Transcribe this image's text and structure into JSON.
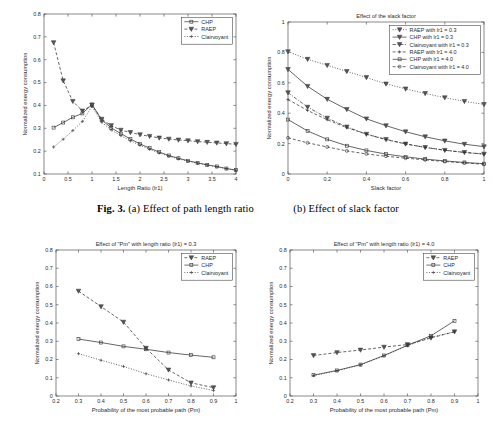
{
  "figure": {
    "caption_label": "Fig. 3.",
    "caption_a": "(a) Effect of path length ratio",
    "caption_b": "(b) Effect of slack factor"
  },
  "axis_common": {
    "ylabel": "Normalized energy consumption"
  },
  "chart_data": [
    {
      "id": "a",
      "type": "line",
      "title": "",
      "xlabel": "Length Ratio (lr1)",
      "ylabel": "Normalized energy consumption",
      "xlim": [
        0,
        4
      ],
      "ylim": [
        0.1,
        0.8
      ],
      "xticks": [
        0,
        0.5,
        1,
        1.5,
        2,
        2.5,
        3,
        3.5,
        4
      ],
      "xticklabels": [
        "0",
        "0.5",
        "1",
        "1.5",
        "2",
        "2.5",
        "3",
        "3.5",
        "4"
      ],
      "yticks": [
        0.1,
        0.2,
        0.3,
        0.4,
        0.5,
        0.6,
        0.7,
        0.8
      ],
      "yticklabels": [
        "0.1",
        "0.2",
        "0.3",
        "0.4",
        "0.5",
        "0.6",
        "0.7",
        "0.8"
      ],
      "grid": false,
      "legend_position": "top-right",
      "x": [
        0.2,
        0.4,
        0.6,
        0.8,
        1.0,
        1.2,
        1.4,
        1.6,
        1.8,
        2.0,
        2.2,
        2.4,
        2.6,
        2.8,
        3.0,
        3.2,
        3.4,
        3.6,
        3.8,
        4.0
      ],
      "series": [
        {
          "name": "CHP",
          "marker": "square",
          "linestyle": "solid",
          "values": [
            0.303,
            0.325,
            0.348,
            0.365,
            0.404,
            0.337,
            0.302,
            0.277,
            0.253,
            0.232,
            0.213,
            0.196,
            0.181,
            0.169,
            0.158,
            0.149,
            0.14,
            0.133,
            0.124,
            0.117
          ]
        },
        {
          "name": "RAEP",
          "marker": "triangle-down",
          "linestyle": "dashed",
          "values": [
            0.675,
            0.508,
            0.418,
            0.376,
            0.402,
            0.34,
            0.312,
            0.292,
            0.282,
            0.272,
            0.265,
            0.258,
            0.253,
            0.249,
            0.246,
            0.242,
            0.239,
            0.236,
            0.233,
            0.23
          ]
        },
        {
          "name": "Clairvoyant",
          "marker": "dot",
          "linestyle": "dotted",
          "values": [
            0.218,
            0.252,
            0.29,
            0.33,
            0.396,
            0.327,
            0.293,
            0.268,
            0.245,
            0.226,
            0.208,
            0.192,
            0.178,
            0.166,
            0.156,
            0.147,
            0.139,
            0.131,
            0.123,
            0.116
          ]
        }
      ]
    },
    {
      "id": "b",
      "type": "line",
      "title": "Effect of the slack factor",
      "xlabel": "Slack factor",
      "ylabel": "Normalized energy consumption",
      "xlim": [
        0,
        1
      ],
      "ylim": [
        0,
        1
      ],
      "xticks": [
        0,
        0.2,
        0.4,
        0.6,
        0.8,
        1
      ],
      "xticklabels": [
        "0",
        "0.2",
        "0.4",
        "0.6",
        "0.8",
        "1"
      ],
      "yticks": [
        0,
        0.2,
        0.4,
        0.6,
        0.8,
        1
      ],
      "yticklabels": [
        "0",
        "0.2",
        "0.4",
        "0.6",
        "0.8",
        "1"
      ],
      "grid": false,
      "legend_position": "top-right",
      "x": [
        0,
        0.1,
        0.2,
        0.3,
        0.4,
        0.5,
        0.6,
        0.7,
        0.8,
        0.9,
        1.0
      ],
      "series": [
        {
          "name": "RAEP with lr1 = 0.3",
          "marker": "triangle-down",
          "linestyle": "dotted",
          "values": [
            0.805,
            0.755,
            0.715,
            0.675,
            0.635,
            0.593,
            0.56,
            0.53,
            0.502,
            0.478,
            0.458
          ]
        },
        {
          "name": "CHP with lr1 = 0.3",
          "marker": "triangle-down",
          "linestyle": "solid",
          "values": [
            0.688,
            0.577,
            0.492,
            0.425,
            0.363,
            0.318,
            0.278,
            0.245,
            0.218,
            0.196,
            0.18
          ]
        },
        {
          "name": "Clairvoyant with lr1 = 0.3",
          "marker": "triangle-down",
          "linestyle": "dashdot",
          "values": [
            0.535,
            0.44,
            0.368,
            0.31,
            0.262,
            0.228,
            0.198,
            0.175,
            0.156,
            0.142,
            0.131
          ]
        },
        {
          "name": "RAEP with lr1 = 4.0",
          "marker": "dot",
          "linestyle": "dashed",
          "values": [
            0.49,
            0.418,
            0.357,
            0.305,
            0.262,
            0.226,
            0.198,
            0.175,
            0.157,
            0.142,
            0.131
          ]
        },
        {
          "name": "CHP with lr1 = 4.0",
          "marker": "square",
          "linestyle": "solid",
          "values": [
            0.358,
            0.283,
            0.228,
            0.186,
            0.155,
            0.131,
            0.113,
            0.098,
            0.086,
            0.076,
            0.068
          ]
        },
        {
          "name": "Clairvoyant with lr1 = 4.0",
          "marker": "circle",
          "linestyle": "dashed",
          "values": [
            0.238,
            0.205,
            0.178,
            0.152,
            0.132,
            0.117,
            0.104,
            0.093,
            0.082,
            0.073,
            0.064
          ]
        }
      ]
    },
    {
      "id": "c",
      "type": "line",
      "title": "Effect of \"Pm\" with length ratio (lr1) = 0.3",
      "xlabel": "Probability of the most probable path (Pm)",
      "ylabel": "Normalized energy consumption",
      "xlim": [
        0.2,
        1
      ],
      "ylim": [
        0,
        0.8
      ],
      "xticks": [
        0.2,
        0.3,
        0.4,
        0.5,
        0.6,
        0.7,
        0.8,
        0.9,
        1
      ],
      "xticklabels": [
        "0.2",
        "0.3",
        "0.4",
        "0.5",
        "0.6",
        "0.7",
        "0.8",
        "0.9",
        "1"
      ],
      "yticks": [
        0,
        0.1,
        0.2,
        0.3,
        0.4,
        0.5,
        0.6,
        0.7,
        0.8
      ],
      "yticklabels": [
        "0",
        "0.1",
        "0.2",
        "0.3",
        "0.4",
        "0.5",
        "0.6",
        "0.7",
        "0.8"
      ],
      "grid": false,
      "legend_position": "top-right",
      "x": [
        0.3,
        0.4,
        0.5,
        0.6,
        0.7,
        0.8,
        0.9
      ],
      "series": [
        {
          "name": "RAEP",
          "marker": "triangle-down",
          "linestyle": "dashed",
          "values": [
            0.575,
            0.49,
            0.405,
            0.262,
            0.143,
            0.072,
            0.046
          ]
        },
        {
          "name": "CHP",
          "marker": "square",
          "linestyle": "solid",
          "values": [
            0.312,
            0.293,
            0.272,
            0.256,
            0.238,
            0.224,
            0.212
          ]
        },
        {
          "name": "Clairvoyant",
          "marker": "dot",
          "linestyle": "dotted",
          "values": [
            0.232,
            0.196,
            0.162,
            0.122,
            0.088,
            0.055,
            0.03
          ]
        }
      ]
    },
    {
      "id": "d",
      "type": "line",
      "title": "Effect of \"Pm\" with length ratio (lr1) = 4.0",
      "xlabel": "Probability of the most probable path (Pm)",
      "ylabel": "Normalized energy consumption",
      "xlim": [
        0.2,
        1
      ],
      "ylim": [
        0,
        0.8
      ],
      "xticks": [
        0.2,
        0.3,
        0.4,
        0.5,
        0.6,
        0.7,
        0.8,
        0.9,
        1
      ],
      "xticklabels": [
        "0.2",
        "0.3",
        "0.4",
        "0.5",
        "0.6",
        "0.7",
        "0.8",
        "0.9",
        "1"
      ],
      "yticks": [
        0,
        0.1,
        0.2,
        0.3,
        0.4,
        0.5,
        0.6,
        0.7,
        0.8
      ],
      "yticklabels": [
        "0",
        "0.1",
        "0.2",
        "0.3",
        "0.4",
        "0.5",
        "0.6",
        "0.7",
        "0.8"
      ],
      "grid": false,
      "legend_position": "top-right",
      "x": [
        0.3,
        0.4,
        0.5,
        0.6,
        0.7,
        0.8,
        0.9
      ],
      "series": [
        {
          "name": "RAEP",
          "marker": "triangle-down",
          "linestyle": "dashed",
          "values": [
            0.222,
            0.238,
            0.252,
            0.268,
            0.282,
            0.318,
            0.352
          ]
        },
        {
          "name": "CHP",
          "marker": "square",
          "linestyle": "solid",
          "values": [
            0.114,
            0.14,
            0.172,
            0.222,
            0.278,
            0.33,
            0.412
          ]
        },
        {
          "name": "Clairvoyant",
          "marker": "dot",
          "linestyle": "dotted",
          "values": [
            0.112,
            0.138,
            0.17,
            0.22,
            0.276,
            0.322,
            0.352
          ]
        }
      ]
    }
  ]
}
